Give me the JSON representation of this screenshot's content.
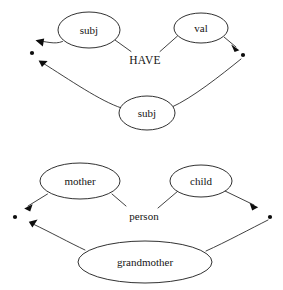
{
  "figure": {
    "background_color": "#ffffff",
    "stroke_color": "#2b2b2b",
    "text_color": "#141414",
    "width": 283,
    "height": 290
  },
  "diagrams": [
    {
      "id": "have-diagram",
      "relation_label": "HAVE",
      "nodes": [
        {
          "id": "subj-top",
          "label": "subj",
          "cx": 89,
          "cy": 30,
          "rx": 31,
          "ry": 18
        },
        {
          "id": "val-top",
          "label": "val",
          "cx": 201,
          "cy": 28,
          "rx": 27,
          "ry": 15
        },
        {
          "id": "subj-bottom",
          "label": "subj",
          "cx": 147,
          "cy": 113,
          "rx": 28,
          "ry": 17
        }
      ],
      "terminals": [
        {
          "id": "left-dot",
          "cx": 32,
          "cy": 53,
          "r": 2.1
        },
        {
          "id": "right-dot",
          "cx": 243,
          "cy": 55,
          "r": 2.1
        }
      ]
    },
    {
      "id": "person-diagram",
      "relation_label": "person",
      "nodes": [
        {
          "id": "mother",
          "label": "mother",
          "cx": 80,
          "cy": 181,
          "rx": 40,
          "ry": 18
        },
        {
          "id": "child",
          "label": "child",
          "cx": 201,
          "cy": 181,
          "rx": 31,
          "ry": 16
        },
        {
          "id": "grandmother",
          "label": "grandmother",
          "cx": 145,
          "cy": 262,
          "rx": 67,
          "ry": 21
        }
      ],
      "terminals": [
        {
          "id": "left-dot-2",
          "cx": 15,
          "cy": 217,
          "r": 2.1
        },
        {
          "id": "right-dot-2",
          "cx": 270,
          "cy": 217,
          "r": 2.1
        }
      ]
    }
  ],
  "labels": {
    "subj_top": "subj",
    "val_top": "val",
    "subj_bottom": "subj",
    "have": "HAVE",
    "mother": "mother",
    "child": "child",
    "grandmother": "grandmother",
    "person": "person"
  }
}
